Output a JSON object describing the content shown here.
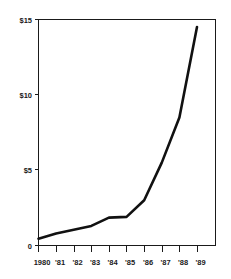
{
  "chart_data": {
    "type": "line",
    "title": "",
    "subtitle": "",
    "xlabel": "",
    "ylabel": "",
    "categories": [
      "1980",
      "'81",
      "'82",
      "'83",
      "'84",
      "'85",
      "'86",
      "'87",
      "'88",
      "'89"
    ],
    "values": [
      0.45,
      0.8,
      1.05,
      1.3,
      1.85,
      1.9,
      3.0,
      5.5,
      8.5,
      14.5
    ],
    "series": [
      {
        "name": "",
        "values": [
          0.45,
          0.8,
          1.05,
          1.3,
          1.85,
          1.9,
          3.0,
          5.5,
          8.5,
          14.5
        ]
      }
    ],
    "x": [
      "1980",
      "'81",
      "'82",
      "'83",
      "'84",
      "'85",
      "'86",
      "'87",
      "'88",
      "'89"
    ],
    "ylim": [
      0,
      15
    ],
    "xlim": [
      "1980",
      "'89"
    ],
    "y_ticks": [
      0,
      5,
      10,
      15
    ],
    "y_tick_labels": [
      "0",
      "$5",
      "$10",
      "$15"
    ],
    "x_ticks": [
      "1980",
      "'81",
      "'82",
      "'83",
      "'84",
      "'85",
      "'86",
      "'87",
      "'88",
      "'89"
    ],
    "grid": false,
    "legend": false,
    "legend_position": "none",
    "annotations": [],
    "line_color": "#111111",
    "axis_color": "#1a1a1a",
    "background_color": "#ffffff"
  },
  "axes": {
    "y_labels": [
      {
        "text": "$15",
        "value": 15
      },
      {
        "text": "$10",
        "value": 10
      },
      {
        "text": "$5",
        "value": 5
      },
      {
        "text": "0",
        "value": 0
      }
    ],
    "x_labels": [
      {
        "text": "1980",
        "value": 0
      },
      {
        "text": "'81",
        "value": 1
      },
      {
        "text": "'82",
        "value": 2
      },
      {
        "text": "'83",
        "value": 3
      },
      {
        "text": "'84",
        "value": 4
      },
      {
        "text": "'85",
        "value": 5
      },
      {
        "text": "'86",
        "value": 6
      },
      {
        "text": "'87",
        "value": 7
      },
      {
        "text": "'88",
        "value": 8
      },
      {
        "text": "'89",
        "value": 9
      }
    ]
  }
}
